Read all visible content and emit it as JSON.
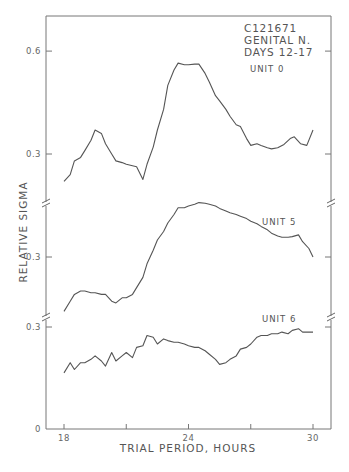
{
  "chart_data": {
    "type": "line",
    "title": "",
    "annotation": [
      "C121671",
      "GENITAL N.",
      "DAYS 12-17"
    ],
    "xlabel": "TRIAL PERIOD, HOURS",
    "ylabel": "RELATIVE SIGMA",
    "xlim": [
      17.1,
      31.2
    ],
    "x_ticks": [
      18,
      21,
      24,
      27,
      30
    ],
    "x_tick_labels": [
      "18",
      "",
      "24",
      "",
      "30"
    ],
    "grid": false,
    "legend": "inline labels",
    "note": "Three vertically offset panels sharing the x-axis; broken y-axis between panels.",
    "panels": [
      {
        "name": "UNIT 0",
        "y_ticks": [
          {
            "value": 0.6,
            "label": "0.6"
          },
          {
            "value": 0.3,
            "label": "0.3"
          }
        ],
        "x": [
          18.0,
          18.3,
          18.5,
          18.8,
          19.0,
          19.3,
          19.5,
          19.8,
          20.0,
          20.3,
          20.5,
          20.8,
          21.0,
          21.3,
          21.5,
          21.8,
          22.0,
          22.3,
          22.5,
          22.8,
          23.0,
          23.3,
          23.5,
          23.8,
          24.0,
          24.3,
          24.5,
          24.8,
          25.0,
          25.3,
          25.5,
          25.8,
          26.0,
          26.3,
          26.5,
          26.8,
          27.0,
          27.3,
          27.5,
          27.8,
          28.0,
          28.3,
          28.6,
          28.9,
          29.1,
          29.4,
          29.7,
          30.0
        ],
        "values": [
          0.22,
          0.24,
          0.28,
          0.29,
          0.31,
          0.34,
          0.37,
          0.36,
          0.33,
          0.3,
          0.28,
          0.275,
          0.27,
          0.266,
          0.263,
          0.226,
          0.27,
          0.32,
          0.37,
          0.43,
          0.5,
          0.545,
          0.565,
          0.56,
          0.56,
          0.562,
          0.562,
          0.535,
          0.51,
          0.47,
          0.455,
          0.43,
          0.41,
          0.385,
          0.38,
          0.345,
          0.325,
          0.33,
          0.325,
          0.318,
          0.315,
          0.318,
          0.328,
          0.345,
          0.35,
          0.33,
          0.325,
          0.37
        ]
      },
      {
        "name": "UNIT 5",
        "y_ticks": [
          {
            "value": 0.3,
            "label": "0.3"
          }
        ],
        "x": [
          18.0,
          18.3,
          18.5,
          18.8,
          19.0,
          19.3,
          19.5,
          19.8,
          20.0,
          20.3,
          20.5,
          20.8,
          21.0,
          21.3,
          21.5,
          21.8,
          22.0,
          22.3,
          22.5,
          22.8,
          23.0,
          23.3,
          23.5,
          23.8,
          24.0,
          24.3,
          24.5,
          24.8,
          25.0,
          25.3,
          25.5,
          25.8,
          26.0,
          26.3,
          26.5,
          26.8,
          27.0,
          27.3,
          27.5,
          27.8,
          28.0,
          28.3,
          28.5,
          28.8,
          29.0,
          29.3,
          29.5,
          29.8,
          30.0
        ],
        "values": [
          0.14,
          0.17,
          0.19,
          0.2,
          0.2,
          0.195,
          0.195,
          0.19,
          0.19,
          0.17,
          0.165,
          0.18,
          0.18,
          0.19,
          0.21,
          0.24,
          0.28,
          0.32,
          0.35,
          0.375,
          0.4,
          0.425,
          0.445,
          0.445,
          0.45,
          0.455,
          0.46,
          0.458,
          0.455,
          0.45,
          0.443,
          0.435,
          0.43,
          0.425,
          0.42,
          0.413,
          0.405,
          0.398,
          0.39,
          0.38,
          0.37,
          0.362,
          0.358,
          0.358,
          0.36,
          0.365,
          0.345,
          0.325,
          0.3,
          0.29,
          0.28,
          0.275
        ]
      },
      {
        "name": "UNIT 6",
        "y_ticks": [
          {
            "value": 0.3,
            "label": "0.3"
          },
          {
            "value": 0,
            "label": "0"
          }
        ],
        "x": [
          18.0,
          18.3,
          18.5,
          18.8,
          19.0,
          19.3,
          19.5,
          19.8,
          20.0,
          20.3,
          20.5,
          20.8,
          21.0,
          21.3,
          21.5,
          21.8,
          22.0,
          22.3,
          22.5,
          22.8,
          23.0,
          23.3,
          23.5,
          23.8,
          24.0,
          24.3,
          24.5,
          24.8,
          25.0,
          25.3,
          25.5,
          25.8,
          26.0,
          26.3,
          26.5,
          26.8,
          27.0,
          27.3,
          27.5,
          27.8,
          28.0,
          28.3,
          28.5,
          28.8,
          29.0,
          29.3,
          29.5,
          29.8,
          30.0
        ],
        "values": [
          0.165,
          0.195,
          0.175,
          0.195,
          0.195,
          0.205,
          0.215,
          0.2,
          0.185,
          0.225,
          0.2,
          0.215,
          0.225,
          0.21,
          0.24,
          0.245,
          0.275,
          0.27,
          0.25,
          0.265,
          0.26,
          0.255,
          0.255,
          0.25,
          0.245,
          0.24,
          0.24,
          0.23,
          0.22,
          0.205,
          0.19,
          0.195,
          0.205,
          0.215,
          0.235,
          0.24,
          0.25,
          0.27,
          0.275,
          0.275,
          0.28,
          0.28,
          0.285,
          0.28,
          0.29,
          0.295,
          0.285,
          0.285,
          0.285
        ]
      }
    ]
  }
}
